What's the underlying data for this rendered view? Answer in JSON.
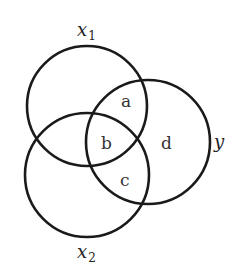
{
  "diagram": {
    "type": "venn",
    "stroke_color": "#1a1a1a",
    "background": "#ffffff",
    "sets": [
      {
        "id": "x1",
        "label": "x",
        "subscript": "1",
        "cx": 87,
        "cy": 106,
        "r": 60
      },
      {
        "id": "x2",
        "label": "x",
        "subscript": "2",
        "cx": 87,
        "cy": 175,
        "r": 62
      },
      {
        "id": "y",
        "label": "y",
        "subscript": "",
        "cx": 148,
        "cy": 142,
        "r": 62
      }
    ],
    "regions": [
      {
        "id": "a",
        "label": "a",
        "description": "x1 ∩ y only"
      },
      {
        "id": "b",
        "label": "b",
        "description": "x1 ∩ x2 ∩ y"
      },
      {
        "id": "c",
        "label": "c",
        "description": "x2 ∩ y only"
      },
      {
        "id": "d",
        "label": "d",
        "description": "y only"
      }
    ]
  }
}
